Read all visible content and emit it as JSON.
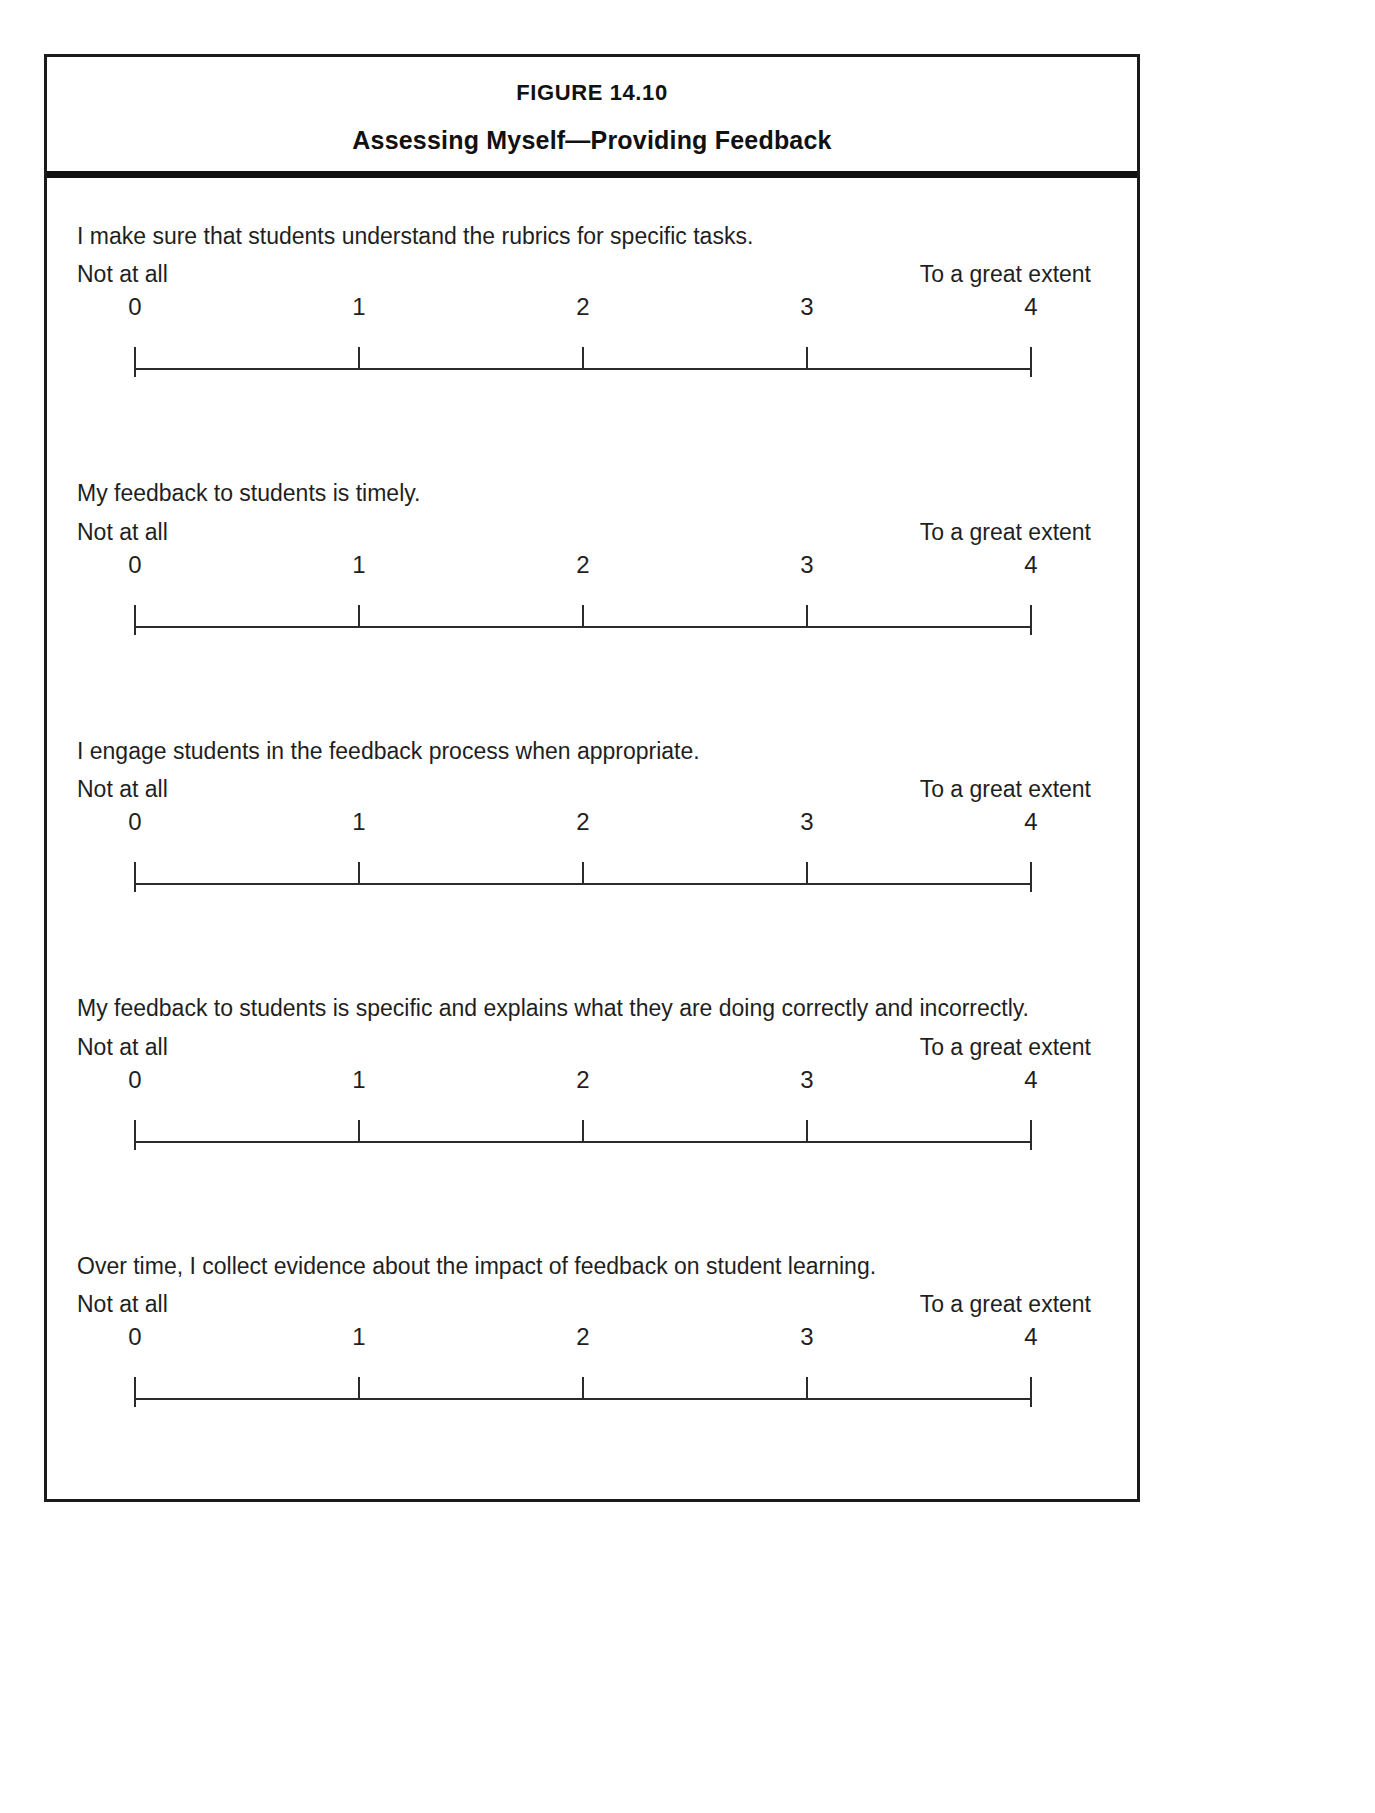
{
  "figure": {
    "number": "FIGURE 14.10",
    "title": "Assessing Myself—Providing Feedback"
  },
  "scale": {
    "anchor_low": "Not at all",
    "anchor_high": "To a great extent",
    "points": [
      "0",
      "1",
      "2",
      "3",
      "4"
    ]
  },
  "items": [
    {
      "question": "I make sure that students understand the rubrics for specific tasks.",
      "anchor_low": "Not at all",
      "anchor_high": "To a great extent",
      "points": [
        "0",
        "1",
        "2",
        "3",
        "4"
      ]
    },
    {
      "question": "My feedback to students is timely.",
      "anchor_low": "Not at all",
      "anchor_high": "To a great extent",
      "points": [
        "0",
        "1",
        "2",
        "3",
        "4"
      ]
    },
    {
      "question": "I engage students in the feedback process when appropriate.",
      "anchor_low": "Not at all",
      "anchor_high": "To a great extent",
      "points": [
        "0",
        "1",
        "2",
        "3",
        "4"
      ]
    },
    {
      "question": "My feedback to students is specific and explains what they are doing correctly and incorrectly.",
      "anchor_low": "Not at all",
      "anchor_high": "To a great extent",
      "points": [
        "0",
        "1",
        "2",
        "3",
        "4"
      ]
    },
    {
      "question": "Over time, I collect evidence about the impact of feedback on student learning.",
      "anchor_low": "Not at all",
      "anchor_high": "To a great extent",
      "points": [
        "0",
        "1",
        "2",
        "3",
        "4"
      ]
    }
  ],
  "colors": {
    "ink": "#1f1f1f",
    "rule": "#2b2b2b",
    "border": "#1b1b1b",
    "header_rule": "#111111",
    "paper": "#ffffff"
  }
}
